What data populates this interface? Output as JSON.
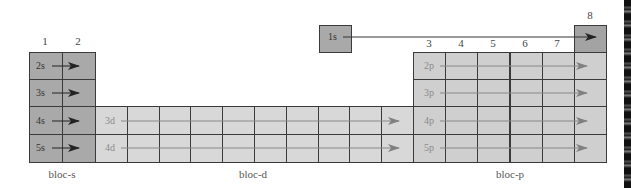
{
  "group_labels": {
    "g1": "1",
    "g2": "2",
    "g3": "3",
    "g4": "4",
    "g5": "5",
    "g6": "6",
    "g7": "7",
    "g8": "8"
  },
  "orbitals": {
    "s": [
      "1s",
      "2s",
      "3s",
      "4s",
      "5s"
    ],
    "d": [
      "3d",
      "4d"
    ],
    "p": [
      "2p",
      "3p",
      "4p",
      "5p"
    ]
  },
  "blocks": {
    "s": "bloc-s",
    "d": "bloc-d",
    "p": "bloc-p"
  },
  "colors": {
    "s_block": "#a9a9a9",
    "d_block": "#d8d8d8",
    "p_block": "#cfcfcf",
    "grid_line": "#3a3a3a",
    "arrow_dark": "#222222",
    "arrow_light": "#7f7f7f"
  }
}
